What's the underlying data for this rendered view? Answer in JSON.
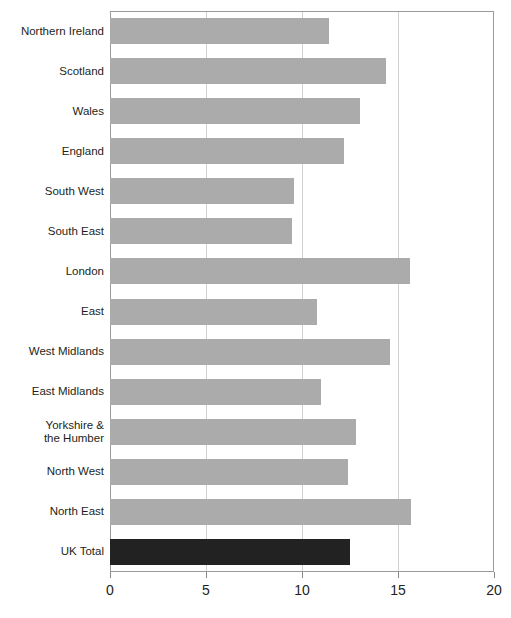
{
  "chart_data": {
    "type": "bar",
    "orientation": "horizontal",
    "title": "",
    "subtitle": "",
    "xlabel": "",
    "ylabel": "",
    "xlim": [
      0,
      20
    ],
    "xticks": [
      "0",
      "5",
      "10",
      "15",
      "20"
    ],
    "xtick_values": [
      0,
      5,
      10,
      15,
      20
    ],
    "gridlines": [
      5,
      10,
      15
    ],
    "grid": true,
    "legend": "none",
    "categories": [
      "Northern Ireland",
      "Scotland",
      "Wales",
      "England",
      "South West",
      "South East",
      "London",
      "East",
      "West Midlands",
      "East Midlands",
      "Yorkshire &\nthe Humber",
      "North West",
      "North East",
      "UK Total"
    ],
    "values": [
      11.4,
      14.4,
      13.0,
      12.2,
      9.6,
      9.5,
      15.6,
      10.8,
      14.6,
      11.0,
      12.8,
      12.4,
      15.7,
      12.5
    ],
    "series": [
      {
        "name": "Value",
        "values": [
          11.4,
          14.4,
          13.0,
          12.2,
          9.6,
          9.5,
          15.6,
          10.8,
          14.6,
          11.0,
          12.8,
          12.4,
          15.7,
          12.5
        ]
      }
    ],
    "highlight_category": "UK Total",
    "colors": {
      "bar": "#ababab",
      "bar_highlight": "#222222",
      "gridline": "#cfcfcf",
      "axis": "#9a9a9a",
      "text": "#231f20",
      "background": "#ffffff"
    }
  }
}
